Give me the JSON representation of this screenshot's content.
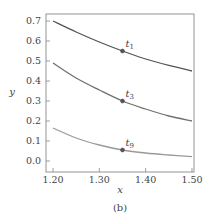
{
  "chart_data": {
    "type": "line",
    "title": "",
    "caption": "(b)",
    "xlabel": "x",
    "ylabel": "y",
    "xlim": [
      1.185,
      1.505
    ],
    "ylim": [
      -0.055,
      0.735
    ],
    "xticks": [
      1.2,
      1.3,
      1.4,
      1.5
    ],
    "xtick_labels": [
      "1.20",
      "1.30",
      "1.40",
      "1.50"
    ],
    "yticks": [
      0.0,
      0.1,
      0.2,
      0.3,
      0.4,
      0.5,
      0.6,
      0.7
    ],
    "ytick_labels": [
      "0.0",
      "0.1",
      "0.2",
      "0.3",
      "0.4",
      "0.5",
      "0.6",
      "0.7"
    ],
    "grid": false,
    "legend": null,
    "x": [
      1.2,
      1.25,
      1.3,
      1.35,
      1.4,
      1.45,
      1.5
    ],
    "series": [
      {
        "name": "t1",
        "label_main": "t",
        "label_sub": "1",
        "color": "#555555",
        "values": [
          0.7,
          0.645,
          0.595,
          0.55,
          0.51,
          0.478,
          0.45
        ]
      },
      {
        "name": "t3",
        "label_main": "t",
        "label_sub": "3",
        "color": "#707070",
        "values": [
          0.49,
          0.415,
          0.355,
          0.3,
          0.26,
          0.225,
          0.2
        ]
      },
      {
        "name": "t9",
        "label_main": "t",
        "label_sub": "9",
        "color": "#9a9a9a",
        "values": [
          0.165,
          0.115,
          0.08,
          0.055,
          0.04,
          0.03,
          0.022
        ]
      }
    ],
    "markers": [
      {
        "series": "t1",
        "x": 1.35,
        "y": 0.55
      },
      {
        "series": "t3",
        "x": 1.35,
        "y": 0.3
      },
      {
        "series": "t9",
        "x": 1.35,
        "y": 0.055
      }
    ]
  }
}
